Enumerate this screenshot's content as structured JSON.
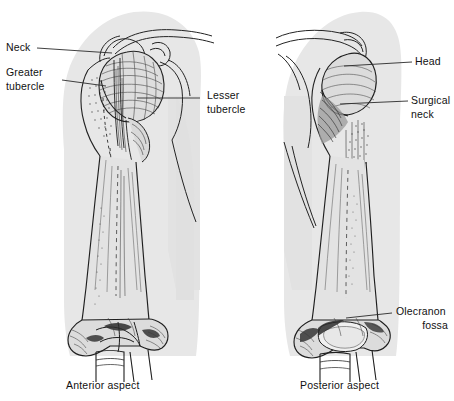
{
  "figure": {
    "background_color": "#ffffff",
    "soft_tissue_color": "#e6e6e6",
    "bone_outline_color": "#1f1f1f",
    "leader_line_color": "#2a2a2a",
    "text_color": "#111111"
  },
  "labels": {
    "neck": "Neck",
    "greater_tubercle_line1": "Greater",
    "greater_tubercle_line2": "tubercle",
    "lesser_tubercle_line1": "Lesser",
    "lesser_tubercle_line2": "tubercle",
    "head": "Head",
    "surgical_neck_line1": "Surgical",
    "surgical_neck_line2": "neck",
    "olecranon_fossa_line1": "Olecranon",
    "olecranon_fossa_line2": "fossa"
  },
  "captions": {
    "left": "Anterior aspect",
    "right": "Posterior aspect"
  }
}
